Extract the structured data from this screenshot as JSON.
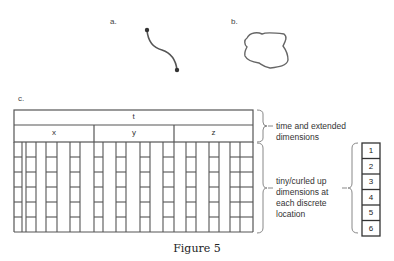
{
  "figure": {
    "caption": "Figure 5",
    "panels": {
      "a": {
        "label": "a.",
        "description": "curved string segment with two endpoints"
      },
      "b": {
        "label": "b.",
        "description": "closed loop"
      },
      "c": {
        "label": "c."
      }
    }
  },
  "table": {
    "top_header": "t",
    "sub_headers": [
      "x",
      "y",
      "z"
    ],
    "rows_per_location": 6
  },
  "annotations": {
    "time_extended": "time and extended dimensions",
    "time_extended_lines": [
      "time and extended",
      "dimensions"
    ],
    "tiny_curled_lines": [
      "tiny/curled up",
      "dimensions at",
      "each discrete",
      "location"
    ]
  },
  "dimension_column": {
    "values": [
      "1",
      "2",
      "3",
      "4",
      "5",
      "6"
    ]
  },
  "colors": {
    "line": "#555555",
    "text": "#333333",
    "background": "#ffffff"
  }
}
